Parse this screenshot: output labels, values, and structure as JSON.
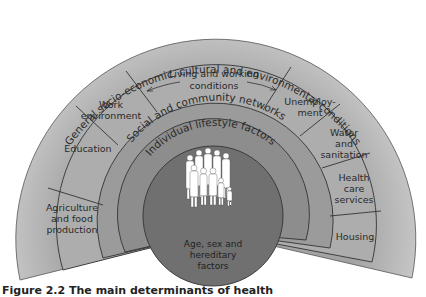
{
  "diagram": {
    "title": "Main determinants of health",
    "layers": {
      "outer": "General socio-economic, cultural and environmental conditions",
      "living": "Living and working conditions",
      "living_line1": "Living and working",
      "living_line2": "conditions",
      "social": "Social and community networks",
      "individual": "Individual lifestyle factors",
      "core_line1": "Age, sex and",
      "core_line2": "hereditary",
      "core_line3": "factors"
    },
    "sectors": {
      "agriculture": [
        "Agriculture",
        "and food",
        "production"
      ],
      "education": [
        "Education"
      ],
      "work": [
        "Work",
        "environment"
      ],
      "unemployment": [
        "Unemploy-",
        "ment"
      ],
      "water": [
        "Water",
        "and",
        "sanitation"
      ],
      "health": [
        "Health",
        "care",
        "services"
      ],
      "housing": [
        "Housing"
      ]
    },
    "colors": {
      "outer_ring": "#b9b9b9",
      "living_ring": "#a9a9a9",
      "social_ring": "#9a9a9a",
      "individual_ring": "#8a8a8a",
      "core": "#6f6f6f",
      "lines": "#333333",
      "figures": "#ffffff"
    },
    "caption": "Figure 2.2   The main determinants of health"
  }
}
